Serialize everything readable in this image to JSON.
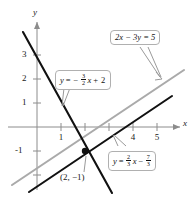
{
  "figure": {
    "type": "graph",
    "axes": {
      "x_axis_label": "x",
      "y_axis_label": "y",
      "x_ticks_visible": [
        "1",
        "4",
        "5"
      ],
      "y_ticks_visible": [
        "3",
        "2",
        "1",
        "-1"
      ],
      "x_range": [
        -0.6,
        6.0
      ],
      "y_range": [
        -2.3,
        3.6
      ],
      "unit_px": 24,
      "origin_px": [
        37,
        127
      ]
    },
    "colors": {
      "line_black": "#111111",
      "line_gray": "#aaaaaa",
      "axis": "#8c8c8c",
      "callout_border": "#b0b0b0",
      "text": "#1a1a1a"
    },
    "lines": [
      {
        "name": "line-steep-negative",
        "color": "#111111",
        "slope": -1.5,
        "intercept": 2,
        "label_parts": {
          "lhs": "y",
          "eq": "=",
          "sign": "−",
          "num": "3",
          "den": "2",
          "var": "x",
          "plus": "+",
          "const": "2"
        }
      },
      {
        "name": "line-gray-standard",
        "color": "#aaaaaa",
        "slope": 0.6666666667,
        "intercept": -1.6666666667,
        "label_text": "2x − 3y = 5"
      },
      {
        "name": "line-shallow-positive",
        "color": "#111111",
        "slope": 0.6666666667,
        "intercept": -2.3333333333,
        "label_parts": {
          "lhs": "y",
          "eq": "=",
          "num": "2",
          "den": "3",
          "var": "x",
          "minus": "−",
          "cnum": "7",
          "cden": "3"
        }
      }
    ],
    "intersection": {
      "name": "intersection-point",
      "label": "(2, −1)",
      "x": 2,
      "y": -1
    }
  }
}
